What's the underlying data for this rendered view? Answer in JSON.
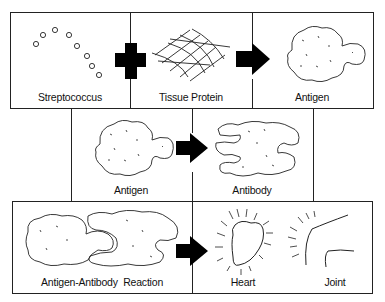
{
  "diagram": {
    "rows": [
      {
        "panels": [
          {
            "id": "streptococcus",
            "label": "Streptococcus",
            "icon": "streptococcus-chain-icon"
          },
          {
            "id": "tissue-protein",
            "label": "Tissue Protein",
            "icon": "tissue-mesh-icon"
          },
          {
            "id": "antigen-1",
            "label": "Antigen",
            "icon": "antigen-blob-icon"
          }
        ],
        "connectors": [
          "plus",
          "arrow-right"
        ]
      },
      {
        "panels": [
          {
            "id": "antigen-2",
            "label": "Antigen",
            "icon": "antigen-blob-icon"
          },
          {
            "id": "antibody",
            "label": "Antibody",
            "icon": "antibody-blob-icon"
          }
        ],
        "connectors": [
          "arrow-right"
        ]
      },
      {
        "panels": [
          {
            "id": "reaction",
            "label": "Antigen-Antibody  Reaction",
            "icon": "antigen-antibody-complex-icon"
          },
          {
            "id": "heart",
            "label": "Heart",
            "icon": "inflamed-heart-icon"
          },
          {
            "id": "joint",
            "label": "Joint",
            "icon": "inflamed-joint-icon"
          }
        ],
        "connectors": [
          "arrow-right"
        ]
      }
    ],
    "colors": {
      "stroke": "#222222",
      "fill": "#000000",
      "background": "#ffffff"
    }
  }
}
